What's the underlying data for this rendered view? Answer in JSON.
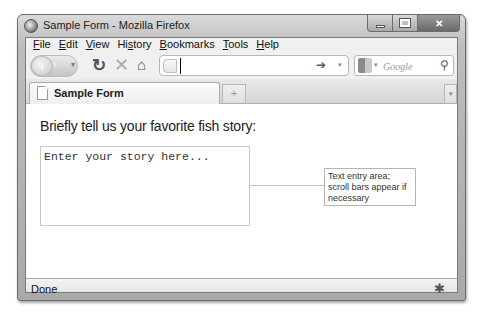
{
  "window": {
    "title": "Sample Form - Mozilla Firefox",
    "controls": {
      "minimize": "minimize",
      "maximize": "maximize",
      "close": "✕"
    }
  },
  "menubar": {
    "items": [
      {
        "accel": "F",
        "rest": "ile"
      },
      {
        "accel": "E",
        "rest": "dit"
      },
      {
        "accel": "V",
        "rest": "iew"
      },
      {
        "pre": "Hi",
        "accel": "s",
        "rest": "tory"
      },
      {
        "accel": "B",
        "rest": "ookmarks"
      },
      {
        "accel": "T",
        "rest": "ools"
      },
      {
        "accel": "H",
        "rest": "elp"
      }
    ]
  },
  "navbar": {
    "back_icon": "‹",
    "forward_icon": "›",
    "history_dropdown_icon": "▾",
    "reload_icon": "↻",
    "stop_icon": "✕",
    "home_icon": "⌂",
    "url_value": "",
    "go_icon": "➔",
    "url_dropdown_icon": "▾",
    "search_engine_dropdown_icon": "▾",
    "search_placeholder": "Google",
    "search_icon": "⚲"
  },
  "tabs": {
    "items": [
      {
        "label": "Sample Form",
        "active": true
      }
    ],
    "new_tab_icon": "+",
    "all_tabs_icon": "▾"
  },
  "page": {
    "prompt": "Briefly tell us your favorite fish story:",
    "textarea_value": "Enter your story here...",
    "callout": "Text entry area; scroll bars appear if necessary"
  },
  "statusbar": {
    "text": "Done",
    "addon_icon": "✱"
  }
}
